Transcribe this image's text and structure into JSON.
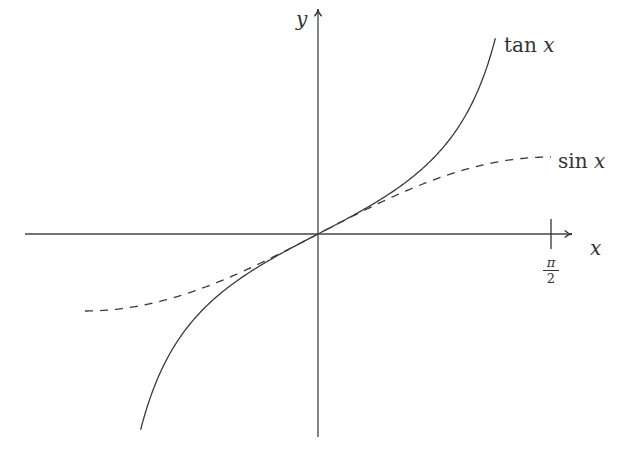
{
  "figure": {
    "axes": {
      "x_label": "x",
      "y_label": "y",
      "x_tick_label": {
        "numerator": "π",
        "denominator": "2"
      }
    },
    "curves": [
      {
        "name": "tan",
        "label_fn": "tan",
        "label_var": "x",
        "style": "solid",
        "color": "#3a3a3a"
      },
      {
        "name": "sin",
        "label_fn": "sin",
        "label_var": "x",
        "style": "dashed",
        "color": "#3a3a3a"
      }
    ]
  },
  "chart_data": {
    "type": "line",
    "title": "",
    "xlabel": "x",
    "ylabel": "y",
    "x_ticks": [
      {
        "value": 1.5708,
        "label": "π/2"
      }
    ],
    "xlim": [
      -1.97,
      1.72
    ],
    "ylim": [
      -2.64,
      2.94
    ],
    "grid": false,
    "legend_position": "inline labels at right ends of curves",
    "series": [
      {
        "name": "tan x",
        "style": "solid",
        "x": [
          -1.2,
          -1.0,
          -0.8,
          -0.6,
          -0.4,
          -0.2,
          0,
          0.2,
          0.4,
          0.6,
          0.8,
          1.0,
          1.2
        ],
        "values": [
          -2.57,
          -1.56,
          -1.03,
          -0.68,
          -0.42,
          -0.2,
          0,
          0.2,
          0.42,
          0.68,
          1.03,
          1.56,
          2.57
        ]
      },
      {
        "name": "sin x",
        "style": "dashed",
        "x": [
          -1.5708,
          -1.2,
          -0.8,
          -0.4,
          0,
          0.4,
          0.8,
          1.2,
          1.5708
        ],
        "values": [
          -1.0,
          -0.93,
          -0.72,
          -0.39,
          0,
          0.39,
          0.72,
          0.93,
          1.0
        ]
      }
    ]
  }
}
